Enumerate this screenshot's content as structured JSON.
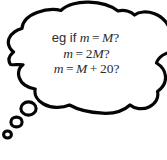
{
  "figure": {
    "type": "thought-bubble",
    "background_color": "#ffffff",
    "outline_color": "#050505",
    "fill_color": "#ffffff",
    "text_color": "#2d2d2d",
    "outline_width_px": 3.2
  },
  "bubble": {
    "lines": [
      {
        "id": "line-1",
        "full_text": "eg if m = M?",
        "tokens": [
          {
            "kind": "roman",
            "text": "eg if"
          },
          {
            "kind": "space",
            "text": " "
          },
          {
            "kind": "mathvar",
            "text": "m"
          },
          {
            "kind": "op",
            "text": "="
          },
          {
            "kind": "mathvar",
            "text": "M"
          },
          {
            "kind": "qmark",
            "text": "?"
          }
        ]
      },
      {
        "id": "line-2",
        "full_text": "m = 2M?",
        "tokens": [
          {
            "kind": "mathvar",
            "text": "m"
          },
          {
            "kind": "op",
            "text": "="
          },
          {
            "kind": "num",
            "text": "2"
          },
          {
            "kind": "mathvar",
            "text": "M"
          },
          {
            "kind": "qmark",
            "text": "?"
          }
        ]
      },
      {
        "id": "line-3",
        "full_text": "m = M + 20?",
        "tokens": [
          {
            "kind": "mathvar",
            "text": "m"
          },
          {
            "kind": "op",
            "text": "="
          },
          {
            "kind": "mathvar",
            "text": "M"
          },
          {
            "kind": "op",
            "text": "+"
          },
          {
            "kind": "num",
            "text": "20"
          },
          {
            "kind": "qmark",
            "text": "?"
          }
        ]
      }
    ]
  },
  "tail": {
    "bubbles": [
      {
        "id": "tail-bubble-large",
        "cx": 28.5,
        "cy": 108.5,
        "rx": 7.6,
        "ry": 6.6
      },
      {
        "id": "tail-bubble-medium",
        "cx": 16.5,
        "cy": 122.0,
        "rx": 5.6,
        "ry": 4.9
      },
      {
        "id": "tail-bubble-small",
        "cx": 7.5,
        "cy": 134.5,
        "rx": 3.9,
        "ry": 3.5
      }
    ]
  },
  "geometry": {
    "cloud_path": "M 10.5 64.5 C 6.0 57.5 12.5 53.0 13.5 52.0 C 9.5 48.5 7.0 44.0 9.0 38.5 C 11.0 33.0 17.5 29.5 22.0 28.5 C 22.5 21.0 29.0 15.5 37.0 12.5 C 46.0 9.2 55.5 9.0 61.0 10.5 C 66.5 4.5 78.0 1.8 89.0 2.2 C 101.0 2.6 111.5 6.0 118.0 11.0 C 124.0 9.5 131.0 11.0 134.5 15.0 C 139.0 11.5 147.0 11.0 154.0 13.5 C 161.0 16.0 166.0 21.0 169.0 27.0 L 169 52 C 163.5 53.5 158.0 57.5 156.5 63.0 C 161.0 66.0 164.5 70.5 165.0 76.0 C 165.5 82.0 162.5 87.5 158.0 91.0 C 159.5 97.5 156.0 103.5 149.5 106.5 C 143.0 109.5 135.0 108.5 130.5 105.0 C 125.0 110.5 114.0 113.5 103.0 113.0 C 90.0 112.4 78.0 109.5 70.0 105.0 C 62.0 108.5 51.0 108.0 44.0 104.0 C 37.5 100.3 34.5 94.5 35.5 89.0 C 28.0 88.0 21.5 83.5 19.5 77.5 C 17.7 72.0 19.5 67.5 23.0 64.5 C 18.5 64.0 13.5 65.0 10.5 64.5 Z"
  }
}
